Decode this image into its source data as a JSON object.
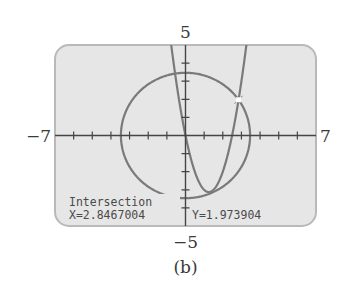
{
  "figure": {
    "caption": "(b)",
    "colors": {
      "screen_bg": "#e6e6e6",
      "screen_border": "#b9b9b9",
      "curve": "#7a7a7a",
      "axis": "#454545",
      "text": "#4a4a4a",
      "marker": "#ffffff"
    }
  },
  "window": {
    "xmin_label": "−7",
    "xmax_label": "7",
    "ymax_label": "5",
    "ymin_label": "−5"
  },
  "screen": {
    "trace_title": "Intersection",
    "x_readout": "X=2.8467004",
    "y_readout": "Y=1.973904"
  },
  "chart_data": {
    "type": "line",
    "title": "",
    "xlabel": "",
    "ylabel": "",
    "xlim": [
      -7,
      7
    ],
    "ylim": [
      -5,
      5
    ],
    "xscale": 1,
    "yscale": 1,
    "grid": false,
    "tick_labels": {
      "xmin": "−7",
      "xmax": "7",
      "ymin": "−5",
      "ymax": "5"
    },
    "series": [
      {
        "name": "circle",
        "equation": "x^2 + y^2 = 12",
        "center": [
          0,
          0
        ],
        "radius": 3.4641
      },
      {
        "name": "parabola",
        "equation": "y = 2x^2 - 5x",
        "a": 2,
        "b": -5,
        "c": 0
      }
    ],
    "annotations": [
      {
        "type": "intersection",
        "x": 2.8467004,
        "y": 1.973904,
        "label": "Intersection",
        "x_text": "X=2.8467004",
        "y_text": "Y=1.973904"
      }
    ],
    "caption": "(b)"
  }
}
